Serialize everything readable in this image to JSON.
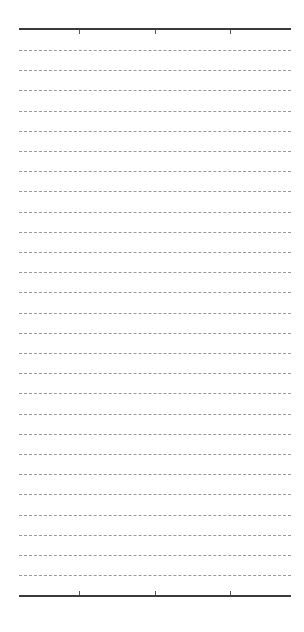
{
  "panel": {
    "top_axis_y": 28,
    "bottom_axis_y": 595,
    "axis_left": 19,
    "axis_width": 272,
    "ticks_x": [
      79,
      155,
      230
    ],
    "dashed_lines": {
      "first_y": 50,
      "spacing": 20.2,
      "count": 27
    },
    "colors": {
      "axis": "#3a3a3a",
      "dash": "#9a9a9a",
      "background": "#ffffff"
    }
  }
}
